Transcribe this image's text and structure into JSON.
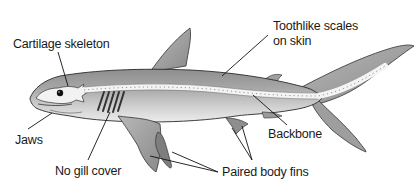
{
  "diagram": {
    "labels": {
      "cartilage_skeleton": "Cartilage skeleton",
      "toothlike_scales_line1": "Toothlike scales",
      "toothlike_scales_line2": "on skin",
      "jaws": "Jaws",
      "no_gill_cover": "No gill cover",
      "backbone": "Backbone",
      "paired_body_fins": "Paired body fins"
    },
    "colors": {
      "body_fill": "#a8a8a8",
      "body_dark": "#7a7a7a",
      "belly_fill": "#e2e2e2",
      "outline": "#2a2a2a",
      "skeleton": "#f4f4f4",
      "label_text": "#1a1a1a",
      "leader_line": "#111111"
    }
  }
}
